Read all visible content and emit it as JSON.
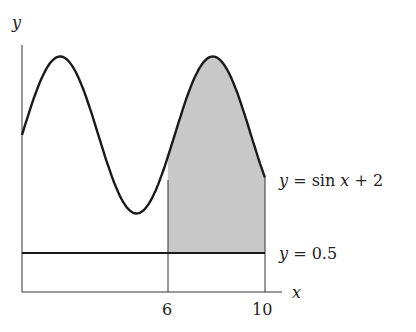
{
  "chart_data": {
    "type": "area",
    "title": "",
    "xlabel": "x",
    "ylabel": "y",
    "xlim": [
      0,
      10
    ],
    "ylim": [
      0,
      3.3
    ],
    "grid": false,
    "x_ticks": [
      6,
      10
    ],
    "x_tick_labels": [
      "6",
      "10"
    ],
    "series": [
      {
        "name": "y = sin x + 2",
        "function": "sin(x)+2",
        "domain": [
          0,
          10
        ],
        "label": "y = sin x + 2"
      },
      {
        "name": "y = 0.5",
        "function": "0.5",
        "domain": [
          0,
          10
        ],
        "label": "y = 0.5"
      }
    ],
    "shaded_region": {
      "between": [
        "y = 0.5",
        "y = sin x + 2"
      ],
      "x_from": 6,
      "x_to": 10,
      "color": "#c8c8c8"
    },
    "vertical_lines": [
      6,
      10
    ]
  },
  "labels": {
    "y_axis": "y",
    "x_axis": "x",
    "tick_6": "6",
    "tick_10": "10",
    "curve_eq_lhs": "y",
    "curve_eq_rhs": " = sin ",
    "curve_eq_x": "x",
    "curve_eq_tail": " + 2",
    "line_eq_lhs": "y",
    "line_eq_rhs": " = 0.5"
  },
  "colors": {
    "line": "#1a1a1a",
    "shade": "#c8c8c8",
    "axis": "#333333"
  }
}
